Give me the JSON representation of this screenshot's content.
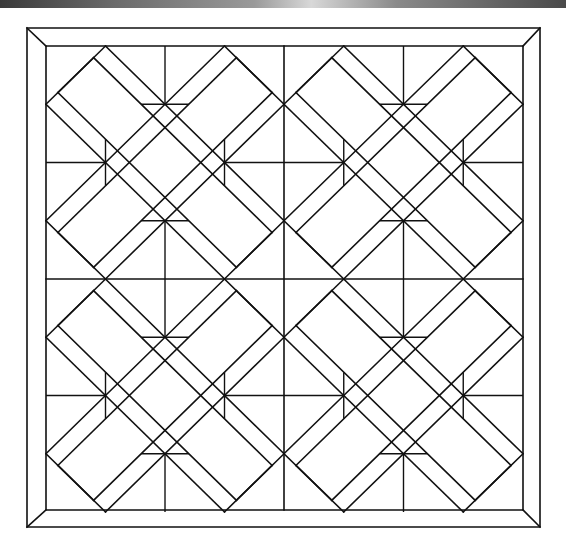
{
  "diagram": {
    "type": "quilt-pattern",
    "colors": {
      "line": "#111111",
      "background": "#ffffff",
      "topbar": "#6a6a6a"
    },
    "border": {
      "outer": {
        "x1": 27,
        "y1": 28,
        "x2": 540,
        "y2": 527
      },
      "inner": {
        "x1": 46,
        "y1": 46,
        "x2": 523,
        "y2": 510
      },
      "mitered_corners": 4
    },
    "grid": {
      "rows": 2,
      "cols": 2,
      "center": [
        284,
        279
      ]
    },
    "blocks": [
      {
        "id": "block-top-left",
        "row": 0,
        "col": 0
      },
      {
        "id": "block-top-right",
        "row": 0,
        "col": 1
      },
      {
        "id": "block-bottom-left",
        "row": 1,
        "col": 0
      },
      {
        "id": "block-bottom-right",
        "row": 1,
        "col": 1
      }
    ],
    "block_motif": {
      "elements": [
        "diagonal-cross-bands",
        "end-cap-strips",
        "central-diamond",
        "four-edge-triangles"
      ]
    }
  }
}
